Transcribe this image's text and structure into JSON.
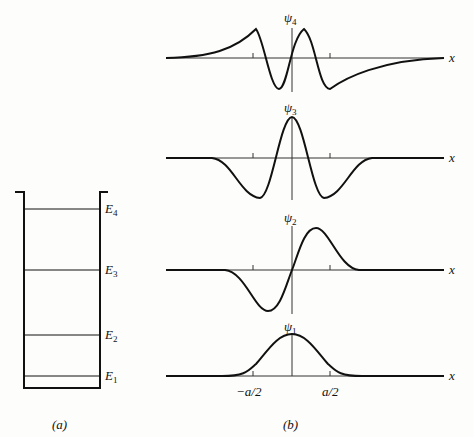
{
  "panel_a": {
    "caption": "(a)",
    "levels": [
      {
        "label": "E",
        "sub": "4",
        "y": 209
      },
      {
        "label": "E",
        "sub": "3",
        "y": 270
      },
      {
        "label": "E",
        "sub": "2",
        "y": 335
      },
      {
        "label": "E",
        "sub": "1",
        "y": 376
      }
    ]
  },
  "panel_b": {
    "caption": "(b)",
    "axis_label": "x",
    "tick_left": "−a/2",
    "tick_right": "a/2",
    "plots": [
      {
        "label": "ψ",
        "sub": "4",
        "axis_y": 58
      },
      {
        "label": "ψ",
        "sub": "3",
        "axis_y": 158
      },
      {
        "label": "ψ",
        "sub": "2",
        "axis_y": 270
      },
      {
        "label": "ψ",
        "sub": "1",
        "axis_y": 376
      }
    ]
  }
}
